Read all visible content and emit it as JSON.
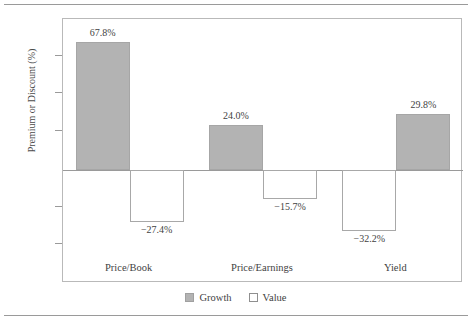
{
  "chart_data": {
    "type": "bar",
    "title": "",
    "xlabel": "",
    "ylabel": "Premium or Discount (%)",
    "ylim": [
      -60,
      80
    ],
    "ytick_values": [
      80,
      60,
      40,
      20,
      0,
      -20,
      -40,
      -60
    ],
    "ytick_labels": [
      "80",
      "60",
      "40",
      "20",
      "S&P 500",
      "−20",
      "−40",
      "−60"
    ],
    "zero_reference_label": "S&P 500",
    "grid": false,
    "legend_position": "bottom-center",
    "categories": [
      "Price/Book",
      "Price/Earnings",
      "Yield"
    ],
    "series": [
      {
        "name": "Growth",
        "color": "#b3b3b3",
        "values": [
          67.8,
          24.0,
          29.8
        ],
        "labels": [
          "67.8%",
          "24.0%",
          "29.8%"
        ]
      },
      {
        "name": "Value",
        "color": "#ffffff",
        "values": [
          -27.4,
          -15.7,
          -32.2
        ],
        "labels": [
          "−27.4%",
          "−15.7%",
          "−32.2%"
        ]
      }
    ],
    "group_series_order": [
      [
        "Growth",
        "Value"
      ],
      [
        "Growth",
        "Value"
      ],
      [
        "Value",
        "Growth"
      ]
    ],
    "legend": [
      {
        "label": "Growth",
        "swatch": "growth"
      },
      {
        "label": "Value",
        "swatch": "value"
      }
    ]
  },
  "colors": {
    "growth_fill": "#b3b3b3",
    "value_fill": "#ffffff",
    "frame": "#b9b9b9",
    "axis": "#9a9a9a",
    "text": "#3f3f3f",
    "background": "#ffffff"
  }
}
